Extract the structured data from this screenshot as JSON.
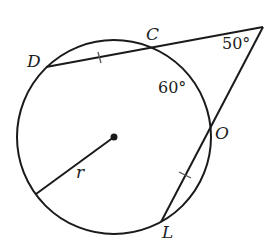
{
  "diagram": {
    "points": {
      "D": "D",
      "C": "C",
      "O": "O",
      "L": "L"
    },
    "radius_label": "r",
    "angles": {
      "exterior": "50°",
      "arc": "60°"
    },
    "circle": {
      "cx": 114,
      "cy": 137,
      "r": 97
    },
    "colors": {
      "stroke": "#1a1a1a"
    }
  }
}
